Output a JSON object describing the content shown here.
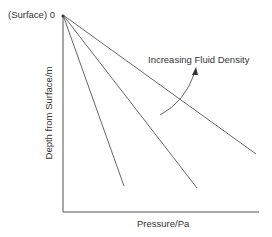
{
  "diagram": {
    "origin_label": "(Surface) 0",
    "y_axis_label": "Depth from Surface/m",
    "x_axis_label": "Pressure/Pa",
    "annotation": "Increasing Fluid Density",
    "line_color": "#555555",
    "lines": [
      {
        "name": "steep",
        "end": [
          124,
          186
        ]
      },
      {
        "name": "middle",
        "end": [
          197,
          188
        ]
      },
      {
        "name": "shallow",
        "end": [
          256,
          154
        ]
      }
    ]
  }
}
